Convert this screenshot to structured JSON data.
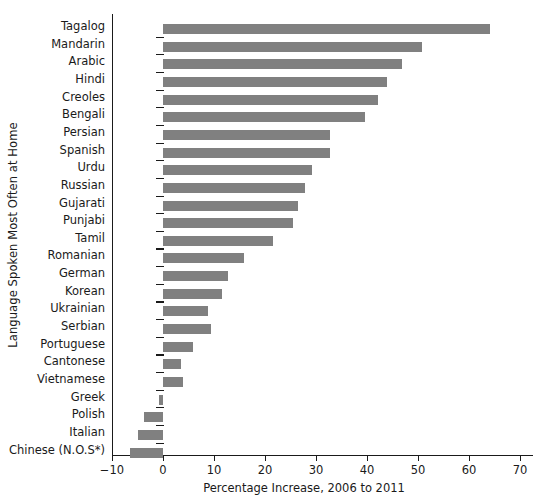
{
  "chart_data": {
    "type": "bar",
    "orientation": "horizontal",
    "title": "",
    "xlabel": "Percentage Increase, 2006 to 2011",
    "ylabel": "Language Spoken Most Often at Home",
    "xlim": [
      -10,
      70
    ],
    "xticks": [
      -10,
      0,
      10,
      20,
      30,
      40,
      50,
      60,
      70
    ],
    "xticklabels": [
      "−10",
      "0",
      "10",
      "20",
      "30",
      "40",
      "50",
      "60",
      "70"
    ],
    "grid": false,
    "legend": false,
    "bar_color": "#808080",
    "axis_color": "#1a1a1a",
    "categories": [
      "Tagalog",
      "Mandarin",
      "Arabic",
      "Hindi",
      "Creoles",
      "Bengali",
      "Persian",
      "Spanish",
      "Urdu",
      "Russian",
      "Gujarati",
      "Punjabi",
      "Tamil",
      "Romanian",
      "German",
      "Korean",
      "Ukrainian",
      "Serbian",
      "Portuguese",
      "Cantonese",
      "Vietnamese",
      "Greek",
      "Polish",
      "Italian",
      "Chinese (N.O.S*)"
    ],
    "values": [
      64.1,
      50.8,
      46.9,
      43.9,
      42.1,
      39.6,
      32.7,
      32.7,
      29.2,
      27.8,
      26.5,
      25.5,
      21.6,
      15.9,
      12.7,
      11.6,
      8.8,
      9.4,
      5.9,
      3.5,
      3.9,
      -0.8,
      -3.7,
      -4.9,
      -6.5
    ]
  }
}
